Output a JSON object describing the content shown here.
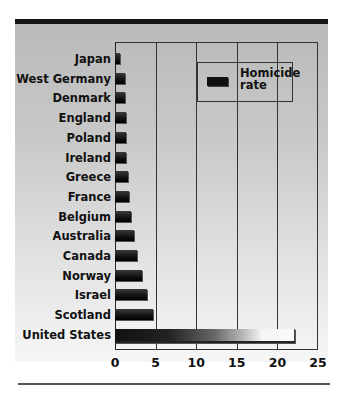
{
  "chart_data": {
    "type": "bar",
    "orientation": "horizontal",
    "title": "",
    "xlabel": "",
    "ylabel": "",
    "categories": [
      "Japan",
      "West Germany",
      "Denmark",
      "England",
      "Poland",
      "Ireland",
      "Greece",
      "France",
      "Belgium",
      "Australia",
      "Canada",
      "Norway",
      "Israel",
      "Scotland",
      "United States"
    ],
    "series": [
      {
        "name": "Homicide rate",
        "values": [
          0.6,
          1.2,
          1.2,
          1.3,
          1.4,
          1.4,
          1.6,
          1.7,
          2.0,
          2.3,
          2.7,
          3.3,
          3.9,
          4.7,
          22.0
        ]
      }
    ],
    "xlim": [
      0,
      25
    ],
    "xticks": [
      0,
      5,
      10,
      15,
      20,
      25
    ],
    "xtick_labels": [
      "0",
      "5",
      "10",
      "15",
      "20",
      "25"
    ],
    "grid": "vertical",
    "legend": {
      "position": "upper right",
      "entries": [
        "Homicide rate"
      ]
    }
  },
  "legend": {
    "label_line1": "Homicide",
    "label_line2": "rate"
  },
  "colors": {
    "bar": "#111111",
    "background": "#c4c4c4",
    "rule": "#151515"
  }
}
